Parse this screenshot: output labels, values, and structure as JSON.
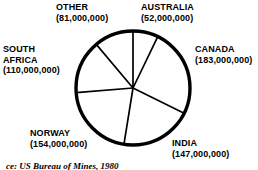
{
  "chart_data": {
    "type": "pie",
    "title": "",
    "subtitle": "",
    "xlabel": "",
    "ylabel": "",
    "legend_position": "labels-around-pie",
    "grid": false,
    "total": 727000000,
    "start_angle_deg": 0,
    "direction": "clockwise",
    "categories": [
      "AUSTRALIA",
      "CANADA",
      "INDIA",
      "NORWAY",
      "SOUTH AFRICA",
      "OTHER"
    ],
    "values": [
      52000000,
      183000000,
      147000000,
      154000000,
      110000000,
      81000000
    ],
    "slices": [
      {
        "id": "australia",
        "label": "AUSTRALIA",
        "value": 52000000,
        "value_text": "(52,000,000)",
        "percent": 7.2,
        "angle_deg": 25.8,
        "start_deg": 0,
        "end_deg": 25.8,
        "color": "#ffffff"
      },
      {
        "id": "canada",
        "label": "CANADA",
        "value": 183000000,
        "value_text": "(183,000,000)",
        "percent": 25.2,
        "angle_deg": 90.6,
        "start_deg": 25.8,
        "end_deg": 116.4,
        "color": "#ffffff"
      },
      {
        "id": "india",
        "label": "INDIA",
        "value": 147000000,
        "value_text": "(147,000,000)",
        "percent": 20.2,
        "angle_deg": 72.8,
        "start_deg": 116.4,
        "end_deg": 189.2,
        "color": "#ffffff"
      },
      {
        "id": "norway",
        "label": "NORWAY",
        "value": 154000000,
        "value_text": "(154,000,000)",
        "percent": 21.2,
        "angle_deg": 76.3,
        "start_deg": 189.2,
        "end_deg": 265.5,
        "color": "#ffffff"
      },
      {
        "id": "south-africa",
        "label": "SOUTH AFRICA",
        "label_line1": "SOUTH",
        "label_line2": "AFRICA",
        "value": 110000000,
        "value_text": "(110,000,000)",
        "percent": 15.1,
        "angle_deg": 54.5,
        "start_deg": 265.5,
        "end_deg": 320.0,
        "color": "#ffffff"
      },
      {
        "id": "other",
        "label": "OTHER",
        "value": 81000000,
        "value_text": "(81,000,000)",
        "percent": 11.1,
        "angle_deg": 40.1,
        "start_deg": 320.0,
        "end_deg": 360.0,
        "color": "#ffffff"
      }
    ],
    "stroke_color": "#000000",
    "fill_color": "#ffffff",
    "outline_width": 3.4,
    "divider_width": 1.7
  },
  "labels": {
    "other": {
      "name": "OTHER",
      "value": "(81,000,000)"
    },
    "australia": {
      "name": "AUSTRALIA",
      "value": "(52,000,000)"
    },
    "canada": {
      "name": "CANADA",
      "value": "(183,000,000)"
    },
    "south_africa": {
      "name_line1": "SOUTH",
      "name_line2": "AFRICA",
      "value": "(110,000,000)"
    },
    "norway": {
      "name": "NORWAY",
      "value": "(154,000,000)"
    },
    "india": {
      "name": "INDIA",
      "value": "(147,000,000)"
    }
  },
  "caption": {
    "text": "ce: US Bureau of Mines, 1980"
  }
}
